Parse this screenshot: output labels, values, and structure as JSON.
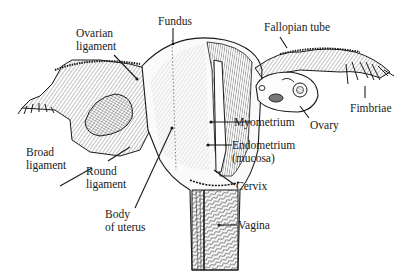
{
  "diagram": {
    "colors": {
      "ink": "#1a1a1a",
      "background": "#ffffff"
    },
    "labels": {
      "fundus": "Fundus",
      "fallopian_tube": "Fallopian tube",
      "ovarian_ligament_1": "Ovarian",
      "ovarian_ligament_2": "ligament",
      "fimbriae": "Fimbriae",
      "myometrium": "Myometrium",
      "ovary": "Ovary",
      "broad_ligament_1": "Broad",
      "broad_ligament_2": "ligament",
      "round_ligament_1": "Round",
      "round_ligament_2": "ligament",
      "endometrium_1": "Endometrium",
      "endometrium_2": "(mucosa)",
      "cervix": "Cervix",
      "body_of_uterus_1": "Body",
      "body_of_uterus_2": "of uterus",
      "vagina": "Vagina"
    }
  }
}
